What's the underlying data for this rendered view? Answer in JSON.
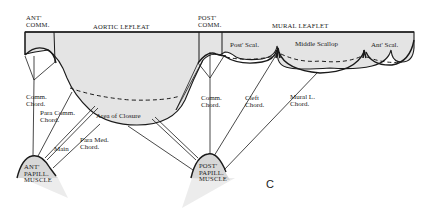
{
  "figure": {
    "panel_label": "C",
    "colors": {
      "leaflet_fill": "#e4e4e4",
      "muscle_fill": "#d7d7d7",
      "shadow_fill": "#ececec",
      "line": "#1a1a1a",
      "background": "#ffffff"
    }
  },
  "top_labels": {
    "ant_comm": [
      "ANT'",
      "COMM."
    ],
    "aortic": "AORTIC LEFLEAT",
    "post_comm": [
      "POST'",
      "COMM."
    ],
    "mural": "MURAL LEAFLET"
  },
  "scallops": {
    "post": "Post' Scal.",
    "middle": "Middle Scallop",
    "ant": "Ant' Scal."
  },
  "chords": {
    "comm_left": [
      "Comm.",
      "Chord."
    ],
    "para_comm": [
      "Para Comm.",
      "Chord."
    ],
    "main": "Main",
    "para_med": [
      "Para Med.",
      "Chord."
    ],
    "comm_right": [
      "Comm.",
      "Chord."
    ],
    "cleft": [
      "Cleft",
      "Chord."
    ],
    "mural": [
      "Mural L.",
      "Chord."
    ]
  },
  "area_label": "Area of Closure",
  "muscles": {
    "ant": [
      "ANT'",
      "PAPILL.",
      "MUSCLE"
    ],
    "post": [
      "POST'",
      "PAPILL.",
      "MUSCLE"
    ]
  }
}
